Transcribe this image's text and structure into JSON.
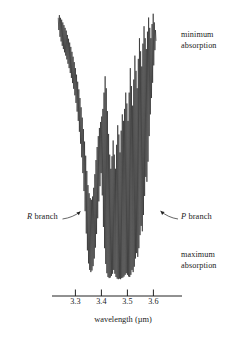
{
  "figure": {
    "type": "spectrum",
    "background_color": "#ffffff",
    "trace_color": "#1a1a1a"
  },
  "annotations": {
    "minimum_absorption": "minimum\nabsorption",
    "minimum_absorption_line1": "minimum",
    "minimum_absorption_line2": "absorption",
    "maximum_absorption_line1": "maximum",
    "maximum_absorption_line2": "absorption",
    "r_branch_letter": "R",
    "r_branch_text": " branch",
    "p_branch_letter": "P",
    "p_branch_text": " branch"
  },
  "axis": {
    "title": "wavelength (µm)",
    "unit": "µm",
    "tick_labels": [
      "3.3",
      "3.4",
      "3.5",
      "3.6"
    ],
    "tick_values": [
      3.3,
      3.4,
      3.5,
      3.6
    ],
    "range": [
      3.21,
      3.71
    ],
    "line_x_start": 52,
    "line_x_end": 182,
    "line_y": 296
  },
  "chart_data": {
    "type": "line",
    "title": "",
    "subtitle": "",
    "xlabel": "wavelength (µm)",
    "ylabel": "",
    "xlim": [
      3.21,
      3.71
    ],
    "ylim": [
      0,
      1
    ],
    "grid": false,
    "legend": null,
    "axis_ticks": [
      3.3,
      3.4,
      3.5,
      3.6
    ],
    "axis_tick_labels": [
      "3.3",
      "3.4",
      "3.5",
      "3.6"
    ],
    "y_axis_semantics": {
      "top": "minimum absorption",
      "bottom": "maximum absorption"
    },
    "branches": [
      {
        "name": "R branch",
        "label_x": 3.245,
        "pointer_to_x": 3.32
      },
      {
        "name": "P branch",
        "label_x": 3.665,
        "pointer_to_x": 3.595
      }
    ],
    "series": [
      {
        "name": "transmission trace",
        "comment": "x = wavelength in micrometres, y = normalized signal where 1 = minimum absorption (top) and 0 = maximum absorption (bottom)",
        "points": [
          [
            3.234,
            0.975
          ],
          [
            3.2362,
            0.93
          ],
          [
            3.2384,
            0.985
          ],
          [
            3.2406,
            0.905
          ],
          [
            3.2428,
            0.975
          ],
          [
            3.245,
            0.888
          ],
          [
            3.2472,
            0.968
          ],
          [
            3.2494,
            0.872
          ],
          [
            3.2516,
            0.958
          ],
          [
            3.2538,
            0.86
          ],
          [
            3.256,
            0.948
          ],
          [
            3.2582,
            0.848
          ],
          [
            3.2604,
            0.938
          ],
          [
            3.2626,
            0.836
          ],
          [
            3.2648,
            0.928
          ],
          [
            3.267,
            0.822
          ],
          [
            3.2692,
            0.912
          ],
          [
            3.2714,
            0.806
          ],
          [
            3.2736,
            0.898
          ],
          [
            3.2758,
            0.79
          ],
          [
            3.278,
            0.884
          ],
          [
            3.2802,
            0.772
          ],
          [
            3.2824,
            0.868
          ],
          [
            3.2846,
            0.754
          ],
          [
            3.2868,
            0.85
          ],
          [
            3.289,
            0.735
          ],
          [
            3.2912,
            0.832
          ],
          [
            3.2934,
            0.714
          ],
          [
            3.2956,
            0.812
          ],
          [
            3.2978,
            0.69
          ],
          [
            3.3,
            0.79
          ],
          [
            3.3022,
            0.662
          ],
          [
            3.3044,
            0.766
          ],
          [
            3.3066,
            0.63
          ],
          [
            3.3088,
            0.74
          ],
          [
            3.311,
            0.596
          ],
          [
            3.3132,
            0.712
          ],
          [
            3.3154,
            0.556
          ],
          [
            3.3176,
            0.68
          ],
          [
            3.3198,
            0.512
          ],
          [
            3.322,
            0.646
          ],
          [
            3.3242,
            0.462
          ],
          [
            3.3264,
            0.608
          ],
          [
            3.3286,
            0.404
          ],
          [
            3.3308,
            0.566
          ],
          [
            3.333,
            0.338
          ],
          [
            3.3352,
            0.52
          ],
          [
            3.3374,
            0.264
          ],
          [
            3.3396,
            0.468
          ],
          [
            3.3418,
            0.182
          ],
          [
            3.344,
            0.412
          ],
          [
            3.3462,
            0.12
          ],
          [
            3.3484,
            0.36
          ],
          [
            3.3506,
            0.072
          ],
          [
            3.3528,
            0.33
          ],
          [
            3.355,
            0.048
          ],
          [
            3.3572,
            0.312
          ],
          [
            3.3594,
            0.04
          ],
          [
            3.3616,
            0.306
          ],
          [
            3.3638,
            0.046
          ],
          [
            3.366,
            0.318
          ],
          [
            3.3682,
            0.062
          ],
          [
            3.3704,
            0.35
          ],
          [
            3.3726,
            0.09
          ],
          [
            3.3748,
            0.4
          ],
          [
            3.377,
            0.13
          ],
          [
            3.3792,
            0.452
          ],
          [
            3.3814,
            0.18
          ],
          [
            3.3836,
            0.5
          ],
          [
            3.3858,
            0.238
          ],
          [
            3.388,
            0.54
          ],
          [
            3.3902,
            0.3
          ],
          [
            3.3924,
            0.57
          ],
          [
            3.3946,
            0.356
          ],
          [
            3.3968,
            0.592
          ],
          [
            3.399,
            0.404
          ],
          [
            3.4012,
            0.612
          ],
          [
            3.4034,
            0.322
          ],
          [
            3.4056,
            0.64
          ],
          [
            3.4078,
            0.206
          ],
          [
            3.41,
            0.7
          ],
          [
            3.4122,
            0.128
          ],
          [
            3.4144,
            0.76
          ],
          [
            3.4166,
            0.07
          ],
          [
            3.4188,
            0.716
          ],
          [
            3.421,
            0.036
          ],
          [
            3.4232,
            0.632
          ],
          [
            3.4254,
            0.022
          ],
          [
            3.4276,
            0.548
          ],
          [
            3.4298,
            0.018
          ],
          [
            3.432,
            0.472
          ],
          [
            3.4342,
            0.02
          ],
          [
            3.4364,
            0.42
          ],
          [
            3.4386,
            0.026
          ],
          [
            3.4408,
            0.466
          ],
          [
            3.443,
            0.034
          ],
          [
            3.4452,
            0.524
          ],
          [
            3.4474,
            0.048
          ],
          [
            3.4496,
            0.472
          ],
          [
            3.4518,
            0.034
          ],
          [
            3.454,
            0.42
          ],
          [
            3.4562,
            0.022
          ],
          [
            3.4584,
            0.508
          ],
          [
            3.4606,
            0.016
          ],
          [
            3.4628,
            0.58
          ],
          [
            3.465,
            0.014
          ],
          [
            3.4672,
            0.546
          ],
          [
            3.4694,
            0.016
          ],
          [
            3.4716,
            0.48
          ],
          [
            3.4738,
            0.014
          ],
          [
            3.476,
            0.56
          ],
          [
            3.4782,
            0.018
          ],
          [
            3.4804,
            0.62
          ],
          [
            3.4826,
            0.02
          ],
          [
            3.4848,
            0.596
          ],
          [
            3.487,
            0.024
          ],
          [
            3.4892,
            0.64
          ],
          [
            3.4914,
            0.03
          ],
          [
            3.4936,
            0.7
          ],
          [
            3.4958,
            0.036
          ],
          [
            3.498,
            0.66
          ],
          [
            3.5002,
            0.03
          ],
          [
            3.5024,
            0.596
          ],
          [
            3.5046,
            0.024
          ],
          [
            3.5068,
            0.7
          ],
          [
            3.509,
            0.022
          ],
          [
            3.5112,
            0.79
          ],
          [
            3.5134,
            0.03
          ],
          [
            3.5156,
            0.724
          ],
          [
            3.5178,
            0.048
          ],
          [
            3.52,
            0.652
          ],
          [
            3.5222,
            0.04
          ],
          [
            3.5244,
            0.748
          ],
          [
            3.5266,
            0.06
          ],
          [
            3.5288,
            0.836
          ],
          [
            3.531,
            0.09
          ],
          [
            3.5332,
            0.78
          ],
          [
            3.5354,
            0.11
          ],
          [
            3.5376,
            0.716
          ],
          [
            3.5398,
            0.096
          ],
          [
            3.542,
            0.824
          ],
          [
            3.5442,
            0.128
          ],
          [
            3.5464,
            0.9
          ],
          [
            3.5486,
            0.176
          ],
          [
            3.5508,
            0.852
          ],
          [
            3.553,
            0.21
          ],
          [
            3.5552,
            0.796
          ],
          [
            3.5574,
            0.19
          ],
          [
            3.5596,
            0.88
          ],
          [
            3.5618,
            0.25
          ],
          [
            3.564,
            0.944
          ],
          [
            3.5662,
            0.32
          ],
          [
            3.5684,
            0.9
          ],
          [
            3.5706,
            0.39
          ],
          [
            3.5728,
            0.86
          ],
          [
            3.575,
            0.372
          ],
          [
            3.5772,
            0.924
          ],
          [
            3.5794,
            0.446
          ],
          [
            3.5816,
            0.976
          ],
          [
            3.5838,
            0.54
          ],
          [
            3.586,
            0.938
          ],
          [
            3.5882,
            0.62
          ],
          [
            3.5904,
            0.9
          ],
          [
            3.5926,
            0.68
          ],
          [
            3.5948,
            0.952
          ],
          [
            3.597,
            0.736
          ],
          [
            3.5992,
            0.99
          ],
          [
            3.6014,
            0.8
          ],
          [
            3.6036,
            0.958
          ],
          [
            3.6058,
            0.856
          ],
          [
            3.608,
            0.93
          ],
          [
            3.6102,
            0.89
          ]
        ]
      }
    ]
  }
}
